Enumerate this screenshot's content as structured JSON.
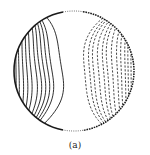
{
  "figure": {
    "caption": "(a)",
    "colors": {
      "line": "#1a1a1a",
      "background": "#ffffff"
    }
  },
  "chart_data": {
    "type": "contour",
    "title": "",
    "panel_label": "(a)",
    "domain": "disk",
    "disk": {
      "cx": 74,
      "cy": 71,
      "r": 60
    },
    "grid": false,
    "legend": null,
    "xlabel": "",
    "ylabel": "",
    "series": [
      {
        "name": "positive contours (solid)",
        "style": "solid",
        "x_at_center": [
          16,
          19,
          23,
          27,
          31,
          36,
          40,
          44,
          48,
          52,
          62
        ]
      },
      {
        "name": "negative contours (dashed)",
        "style": "dashed",
        "x_at_center": [
          84,
          89,
          93,
          98,
          103,
          107,
          112,
          117,
          121,
          125,
          128,
          131
        ]
      }
    ],
    "zero_region": {
      "x_from": 63,
      "x_to": 83,
      "boundary_style": "dotted"
    }
  }
}
